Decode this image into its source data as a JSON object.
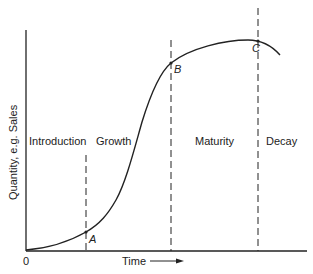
{
  "diagram": {
    "axes": {
      "y_label": "Quantity, e.g. Sales",
      "x_label": "Time",
      "origin_label": "0"
    },
    "stages": [
      {
        "label": "Introduction"
      },
      {
        "label": "Growth"
      },
      {
        "label": "Maturity"
      },
      {
        "label": "Decay"
      }
    ],
    "points": [
      {
        "label": "A"
      },
      {
        "label": "B"
      },
      {
        "label": "C"
      }
    ],
    "colors": {
      "line": "#222222",
      "background": "#ffffff"
    }
  }
}
